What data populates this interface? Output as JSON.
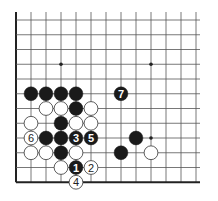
{
  "diagram": {
    "type": "go-board-problem",
    "grid": {
      "origin_x": 16,
      "origin_y": 20,
      "spacing_x": 15,
      "spacing_y": 14.75,
      "columns": 13,
      "rows": 12,
      "left_edge": true,
      "bottom_edge": true,
      "line_color": "#555555",
      "edge_color": "#222222"
    },
    "star_points": [
      {
        "c": 3,
        "r": 3
      },
      {
        "c": 9,
        "r": 3
      },
      {
        "c": 9,
        "r": 8
      }
    ],
    "stones": [
      {
        "c": 1,
        "r": 5,
        "color": "black",
        "label": ""
      },
      {
        "c": 2,
        "r": 5,
        "color": "black",
        "label": ""
      },
      {
        "c": 3,
        "r": 5,
        "color": "black",
        "label": ""
      },
      {
        "c": 4,
        "r": 5,
        "color": "black",
        "label": ""
      },
      {
        "c": 7,
        "r": 5,
        "color": "black",
        "label": "7"
      },
      {
        "c": 2,
        "r": 6,
        "color": "white",
        "label": ""
      },
      {
        "c": 3,
        "r": 6,
        "color": "white",
        "label": ""
      },
      {
        "c": 4,
        "r": 6,
        "color": "black",
        "label": ""
      },
      {
        "c": 5,
        "r": 6,
        "color": "white",
        "label": ""
      },
      {
        "c": 1,
        "r": 7,
        "color": "white",
        "label": ""
      },
      {
        "c": 3,
        "r": 7,
        "color": "black",
        "label": ""
      },
      {
        "c": 4,
        "r": 7,
        "color": "white",
        "label": ""
      },
      {
        "c": 5,
        "r": 7,
        "color": "white",
        "label": ""
      },
      {
        "c": 1,
        "r": 8,
        "color": "white",
        "label": "6"
      },
      {
        "c": 2,
        "r": 8,
        "color": "black",
        "label": ""
      },
      {
        "c": 3,
        "r": 8,
        "color": "black",
        "label": ""
      },
      {
        "c": 4,
        "r": 8,
        "color": "black",
        "label": "3"
      },
      {
        "c": 5,
        "r": 8,
        "color": "black",
        "label": "5"
      },
      {
        "c": 8,
        "r": 8,
        "color": "black",
        "label": ""
      },
      {
        "c": 1,
        "r": 9,
        "color": "white",
        "label": ""
      },
      {
        "c": 2,
        "r": 9,
        "color": "white",
        "label": ""
      },
      {
        "c": 3,
        "r": 9,
        "color": "black",
        "label": ""
      },
      {
        "c": 4,
        "r": 9,
        "color": "white",
        "label": ""
      },
      {
        "c": 7,
        "r": 9,
        "color": "black",
        "label": ""
      },
      {
        "c": 9,
        "r": 9,
        "color": "white",
        "label": ""
      },
      {
        "c": 3,
        "r": 10,
        "color": "white",
        "label": ""
      },
      {
        "c": 4,
        "r": 10,
        "color": "black",
        "label": "1"
      },
      {
        "c": 5,
        "r": 10,
        "color": "white",
        "label": "2"
      },
      {
        "c": 4,
        "r": 11,
        "color": "white",
        "label": "4"
      }
    ],
    "colors": {
      "black_stone": "#1a1a1a",
      "white_stone": "#ffffff",
      "white_stroke": "#333333",
      "black_label": "#ffffff",
      "white_label": "#222222"
    }
  }
}
